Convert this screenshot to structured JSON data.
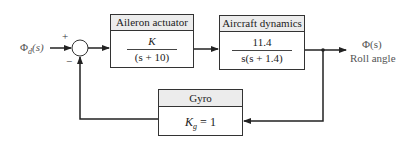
{
  "input": {
    "symbol": "Φ",
    "subscript": "d",
    "arg": "(s)"
  },
  "summing_junction": {
    "plus": "+",
    "minus": "−"
  },
  "blocks": {
    "actuator": {
      "title": "Aileron actuator",
      "numerator": "K",
      "denominator": "(s + 10)"
    },
    "dynamics": {
      "title": "Aircraft dynamics",
      "numerator": "11.4",
      "denominator": "s(s + 1.4)"
    },
    "gyro": {
      "title": "Gyro",
      "gain_symbol": "K",
      "gain_subscript": "g",
      "gain_value": "= 1"
    }
  },
  "output": {
    "symbol": "Φ(s)",
    "label": "Roll angle"
  },
  "colors": {
    "line": "#222222",
    "header_fill": "#ececec",
    "label_text": "#555555"
  }
}
